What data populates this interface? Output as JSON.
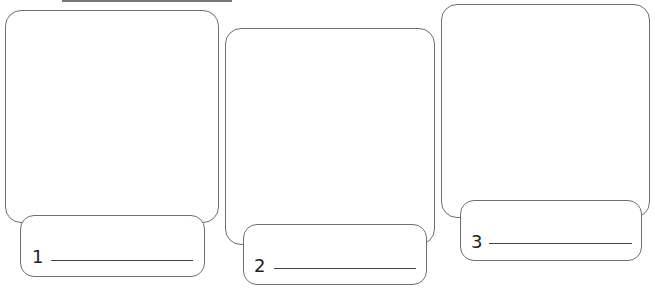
{
  "worksheet": {
    "panels": [
      {
        "number": "1"
      },
      {
        "number": "2"
      },
      {
        "number": "3"
      }
    ]
  },
  "colors": {
    "stroke": "#6e6e6e",
    "text": "#222222",
    "background": "#ffffff"
  }
}
